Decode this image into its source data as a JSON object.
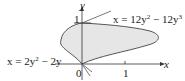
{
  "figure": {
    "axis_x_label": "x",
    "axis_y_label": "y",
    "tick_x_1": "1",
    "tick_y_1": "1",
    "origin_label": "0",
    "curve_right": {
      "lhs": "x = 12y",
      "exp1": "2",
      "mid": " − 12y",
      "exp2": "3"
    },
    "curve_left": {
      "lhs": "x = 2y",
      "exp1": "2",
      "mid": " − 2y"
    },
    "fill_color": "#e6e6e6",
    "line_color": "#555555"
  }
}
